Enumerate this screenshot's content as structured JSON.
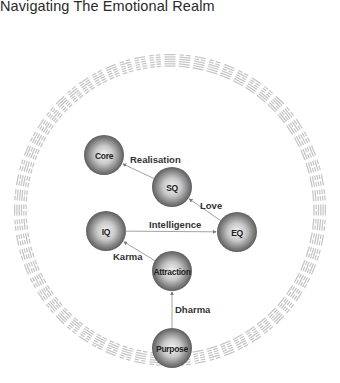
{
  "title": "Navigating The Emotional Realm",
  "colors": {
    "ring": "#c4c4c4",
    "edge": "#8a8a8a",
    "node_light": "#f2f2f2",
    "node_dark": "#6e6e6e",
    "text": "#222222"
  },
  "ring": {
    "cx": 170,
    "cy": 210,
    "radius": 150,
    "count": 64,
    "symbol": "hexagram"
  },
  "nodes": [
    {
      "id": "core",
      "label": "Core",
      "x": 104,
      "y": 155,
      "r": 20
    },
    {
      "id": "sq",
      "label": "SQ",
      "x": 172,
      "y": 187,
      "r": 20
    },
    {
      "id": "iq",
      "label": "IQ",
      "x": 106,
      "y": 231,
      "r": 20
    },
    {
      "id": "eq",
      "label": "EQ",
      "x": 237,
      "y": 232,
      "r": 20
    },
    {
      "id": "attraction",
      "label": "Attraction",
      "x": 172,
      "y": 271,
      "r": 20
    },
    {
      "id": "purpose",
      "label": "Purpose",
      "x": 172,
      "y": 348,
      "r": 20
    }
  ],
  "edges": [
    {
      "from": "sq",
      "to": "core",
      "label": "Realisation",
      "lx": 130,
      "ly": 163
    },
    {
      "from": "eq",
      "to": "sq",
      "label": "Love",
      "lx": 200,
      "ly": 209
    },
    {
      "from": "iq",
      "to": "eq",
      "label": "Intelligence",
      "lx": 149,
      "ly": 228
    },
    {
      "from": "attraction",
      "to": "iq",
      "label": "Karma",
      "lx": 113,
      "ly": 260
    },
    {
      "from": "purpose",
      "to": "attraction",
      "label": "Dharma",
      "lx": 175,
      "ly": 313
    }
  ]
}
